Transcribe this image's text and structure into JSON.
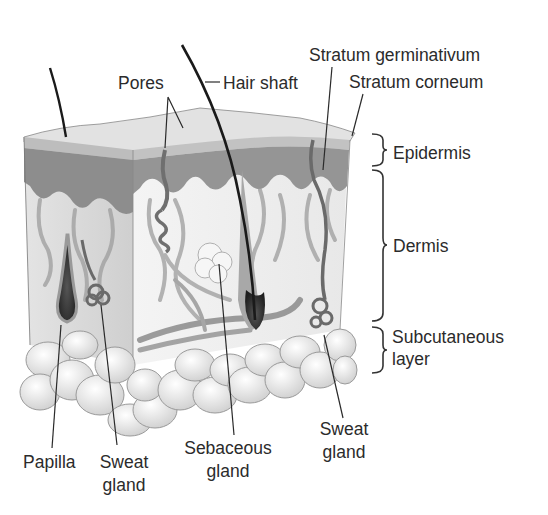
{
  "labels": {
    "pores": "Pores",
    "hair_shaft": "Hair shaft",
    "stratum_germinativum": "Stratum germinativum",
    "stratum_corneum": "Stratum corneum",
    "papilla": "Papilla",
    "sweat_gland_left_1": "Sweat",
    "sweat_gland_left_2": "gland",
    "sebaceous_gland_1": "Sebaceous",
    "sebaceous_gland_2": "gland",
    "sweat_gland_right_1": "Sweat",
    "sweat_gland_right_2": "gland"
  },
  "layers": {
    "epidermis": "Epidermis",
    "dermis": "Dermis",
    "subcutaneous_1": "Subcutaneous",
    "subcutaneous_2": "layer"
  },
  "colors": {
    "surface": "#e6e6e6",
    "epidermis": "#8c8c8c",
    "dermis": "#ececec",
    "dermis_side": "#d6d6d6",
    "vessel": "#9a9a9a",
    "fat": "#f2f2f2",
    "line": "#2a2a2a"
  }
}
